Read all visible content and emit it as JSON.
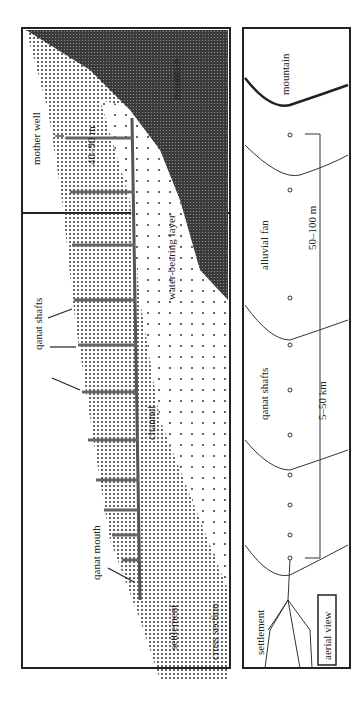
{
  "figure": {
    "cross_section": {
      "panel_label": "cross section",
      "labels": {
        "mountain": "mountain",
        "mother_well": "mother well",
        "depth": "40–90 m",
        "water_layer": "water-bearing layer",
        "qanat_shafts": "qanat shafts",
        "channel": "channel",
        "qanat_mouth": "qanat mouth",
        "settlement": "settlement"
      }
    },
    "aerial_view": {
      "panel_label": "aerial view",
      "labels": {
        "mountain": "mountain",
        "alluvial_fan": "alluvial fan",
        "shaft_spacing": "50–100 m",
        "qanat_shafts": "qanat shafts",
        "length": "5–50 km",
        "settlement": "settlement"
      }
    }
  }
}
